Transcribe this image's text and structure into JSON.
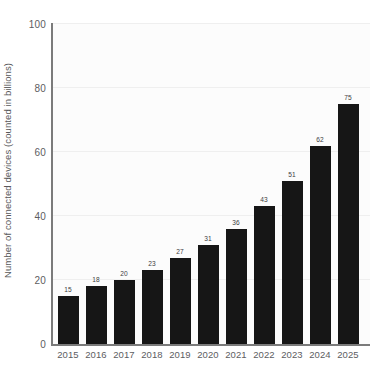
{
  "chart_data": {
    "type": "bar",
    "title": "",
    "xlabel": "",
    "ylabel": "Number of connected devices (counted in billions)",
    "categories": [
      "2015",
      "2016",
      "2017",
      "2018",
      "2019",
      "2020",
      "2021",
      "2022",
      "2023",
      "2024",
      "2025"
    ],
    "values": [
      15,
      18,
      20,
      23,
      27,
      31,
      36,
      43,
      51,
      62,
      75
    ],
    "value_labels": [
      "15",
      "18",
      "20",
      "23",
      "27",
      "31",
      "36",
      "43",
      "51",
      "62",
      "75"
    ],
    "ylim": [
      0,
      100
    ],
    "ytick_labels": [
      "0",
      "20",
      "40",
      "60",
      "80",
      "100"
    ],
    "ytick_values": [
      0,
      20,
      40,
      60,
      80,
      100
    ],
    "grid": true,
    "grid_axis": "y",
    "legend": "none",
    "bar_color": "#161616",
    "grid_color": "#efefef",
    "axis_color": "#7b7b7b",
    "plot_background": "#fcfcfc",
    "text_color": "#5d5d5f"
  }
}
